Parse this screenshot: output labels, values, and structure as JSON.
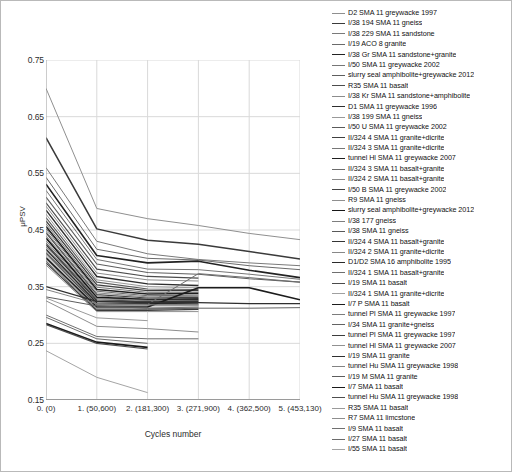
{
  "chart_data": {
    "type": "line",
    "title": "",
    "xlabel": "Cycles number",
    "ylabel": "μPSV",
    "ylim": [
      0.15,
      0.75
    ],
    "yticks": [
      "0.75",
      "0.65",
      "0.55",
      "0.45",
      "0.35",
      "0.25",
      "0.15"
    ],
    "ytick_values": [
      0.75,
      0.65,
      0.55,
      0.45,
      0.35,
      0.25,
      0.15
    ],
    "categories": [
      "0. (0)",
      "1. (50,600)",
      "2. (181,300)",
      "3. (271,900)",
      "4. (362,500)",
      "5. (453,130)"
    ],
    "x_values": [
      0,
      50600,
      181300,
      271900,
      362500,
      453130
    ],
    "grid": true,
    "legend_position": "right",
    "series": [
      {
        "name": "D2 SMA 11 greywacke 1997",
        "color": "#8f8f8f",
        "width": 1.0,
        "values": [
          0.7,
          0.488,
          0.47,
          0.458,
          0.444,
          0.433
        ]
      },
      {
        "name": "I/38 194 SMA 11 gneiss",
        "color": "#3a3a3a",
        "width": 1.5,
        "values": [
          0.613,
          0.452,
          0.432,
          0.425,
          0.412,
          0.399
        ]
      },
      {
        "name": "I/38 229 SMA 11 sandstone",
        "color": "#7a7a7a",
        "width": 1.0,
        "values": [
          0.56,
          0.43,
          0.408,
          0.398,
          0.392,
          0.387
        ]
      },
      {
        "name": "I/19 ACO 8 granite",
        "color": "#6a6a6a",
        "width": 1.0,
        "values": [
          0.543,
          0.416,
          0.4,
          0.397,
          0.387,
          0.38
        ]
      },
      {
        "name": "I/38 Gr SMA 11 sandstone+granite",
        "color": "#222222",
        "width": 1.6,
        "values": [
          0.531,
          0.405,
          0.392,
          0.395,
          0.379,
          0.366
        ]
      },
      {
        "name": "I/50 SMA 11 greywacke 2002",
        "color": "#767676",
        "width": 1.0,
        "values": [
          0.52,
          0.398,
          0.381,
          0.38,
          0.372,
          0.363
        ]
      },
      {
        "name": "slurry seal amphibolite+greywacke 2012",
        "color": "#5e5e5e",
        "width": 1.1,
        "values": [
          0.508,
          0.39,
          0.375,
          0.372,
          0.364,
          0.358
        ]
      },
      {
        "name": "R35 SMA 11 basalt",
        "color": "#4c4c4c",
        "width": 1.2,
        "values": [
          0.498,
          0.381,
          0.368,
          0.365,
          null,
          null
        ]
      },
      {
        "name": "I/38 Kr SMA 11 sandstone+amphibolite",
        "color": "#8c8c8c",
        "width": 1.0,
        "values": [
          0.492,
          0.374,
          0.362,
          0.36,
          null,
          null
        ]
      },
      {
        "name": "D1 SMA 11 greywacke 1996",
        "color": "#2e2e2e",
        "width": 1.4,
        "values": [
          0.485,
          0.368,
          0.355,
          0.352,
          null,
          null
        ]
      },
      {
        "name": "I/38 199 SMA 11 gneiss",
        "color": "#999999",
        "width": 1.0,
        "values": [
          0.478,
          0.362,
          0.35,
          0.348,
          null,
          null
        ]
      },
      {
        "name": "I/50 U SMA 11 greywacke 2002",
        "color": "#5a5a5a",
        "width": 1.1,
        "values": [
          0.472,
          0.358,
          0.346,
          0.345,
          null,
          null
        ]
      },
      {
        "name": "II/324 4 SMA 11 granite+dicrite",
        "color": "#3f3f3f",
        "width": 1.3,
        "values": [
          0.466,
          0.353,
          0.343,
          0.343,
          null,
          null
        ]
      },
      {
        "name": "II/324 3 SMA 11 granite+dicrite",
        "color": "#777777",
        "width": 1.0,
        "values": [
          0.461,
          0.349,
          0.34,
          0.34,
          null,
          null
        ]
      },
      {
        "name": "tunnel Hl SMA 11 greywacke 2007",
        "color": "#1f1f1f",
        "width": 1.6,
        "values": [
          0.456,
          0.345,
          0.337,
          0.338,
          null,
          null
        ]
      },
      {
        "name": "II/324 3 SMA 11 basalt+granite",
        "color": "#6c6c6c",
        "width": 1.0,
        "values": [
          0.452,
          0.342,
          0.334,
          0.335,
          null,
          null
        ]
      },
      {
        "name": "II/324 2 SMA 11 basalt+granite",
        "color": "#8a8a8a",
        "width": 1.0,
        "values": [
          0.448,
          0.339,
          0.332,
          0.333,
          null,
          null
        ]
      },
      {
        "name": "I/50 B SMA 11 greywacke 2002",
        "color": "#444444",
        "width": 1.2,
        "values": [
          0.445,
          0.336,
          0.33,
          0.331,
          null,
          null
        ]
      },
      {
        "name": "R9 SMA 11 gneiss",
        "color": "#8f8f8f",
        "width": 1.0,
        "values": [
          0.44,
          0.334,
          0.328,
          0.329,
          null,
          null
        ]
      },
      {
        "name": "slurry seal amphibolite+greywacke 2012",
        "color": "#161616",
        "width": 1.7,
        "values": [
          0.436,
          0.331,
          0.327,
          0.328,
          null,
          null
        ]
      },
      {
        "name": "I/38 177 gneiss",
        "color": "#7e7e7e",
        "width": 1.0,
        "values": [
          0.431,
          0.329,
          0.326,
          0.326,
          null,
          null
        ]
      },
      {
        "name": "I/38 SMA 11 gneiss",
        "color": "#595959",
        "width": 1.1,
        "values": [
          0.427,
          0.327,
          0.324,
          0.325,
          null,
          null
        ]
      },
      {
        "name": "II/324 4 SMA 11 basalt+granite",
        "color": "#353535",
        "width": 1.3,
        "values": [
          0.424,
          0.325,
          0.323,
          0.324,
          null,
          null
        ]
      },
      {
        "name": "II/324 2 SMA 11 granite+dicrite",
        "color": "#888888",
        "width": 1.0,
        "values": [
          0.42,
          0.323,
          0.322,
          0.322,
          null,
          null
        ]
      },
      {
        "name": "D1/D2 SMA 16 amphibolite 1995",
        "color": "#2a2a2a",
        "width": 1.4,
        "values": [
          0.416,
          0.321,
          0.32,
          0.321,
          null,
          null
        ]
      },
      {
        "name": "II/324 1 SMA 11 basalt+granite",
        "color": "#6f6f6f",
        "width": 1.0,
        "values": [
          0.412,
          0.319,
          0.319,
          0.373,
          0.366,
          0.358
        ]
      },
      {
        "name": "I/19 SMA 11 basalt",
        "color": "#4a4a4a",
        "width": 1.2,
        "values": [
          0.409,
          0.317,
          0.318,
          0.318,
          null,
          null
        ]
      },
      {
        "name": "II/324 1 SMA 11 granite+dicrite",
        "color": "#a0a0a0",
        "width": 1.0,
        "values": [
          0.405,
          0.316,
          0.316,
          0.316,
          null,
          null
        ]
      },
      {
        "name": "I/7 P SMA 11 basalt",
        "color": "#1c1c1c",
        "width": 1.6,
        "values": [
          0.401,
          0.314,
          0.314,
          0.348,
          0.348,
          0.327
        ]
      },
      {
        "name": "tunnel Pl SMA 11 greywacke 1997",
        "color": "#7c7c7c",
        "width": 1.0,
        "values": [
          0.398,
          0.312,
          0.312,
          0.314,
          null,
          null
        ]
      },
      {
        "name": "I/34 SMA 11 granite+gneiss",
        "color": "#636363",
        "width": 1.0,
        "values": [
          0.395,
          0.31,
          0.31,
          0.312,
          0.312,
          0.313
        ]
      },
      {
        "name": "tunnel Pl SMA 11 greywacke 1997",
        "color": "#3c3c3c",
        "width": 1.2,
        "values": [
          0.392,
          0.308,
          0.308,
          0.31,
          null,
          null
        ]
      },
      {
        "name": "tunnel Hl SMA 11 greywacke 2007",
        "color": "#919191",
        "width": 1.0,
        "values": [
          0.388,
          0.306,
          0.306,
          0.306,
          null,
          null
        ]
      },
      {
        "name": "I/19 SMA 11 granite",
        "color": "#2f2f2f",
        "width": 1.3,
        "values": [
          0.35,
          0.324,
          0.322,
          0.322,
          0.32,
          0.32
        ]
      },
      {
        "name": "tunnel Hu SMA 11 greywacke 1998",
        "color": "#838383",
        "width": 1.0,
        "values": [
          0.345,
          0.32,
          0.318,
          0.318,
          null,
          null
        ]
      },
      {
        "name": "I/19 M SMA 11 granite",
        "color": "#5d5d5d",
        "width": 1.0,
        "values": [
          0.332,
          0.316,
          0.312,
          0.312,
          null,
          null
        ]
      },
      {
        "name": "I/7 SMA 11 basalt",
        "color": "#1a1a1a",
        "width": 1.7,
        "values": [
          0.285,
          0.252,
          0.243,
          null,
          null,
          null
        ]
      },
      {
        "name": "tunnel Hu SMA 11 greywacke 1998",
        "color": "#4e4e4e",
        "width": 1.2,
        "values": [
          0.283,
          0.25,
          0.24,
          null,
          null,
          null
        ]
      },
      {
        "name": "R35 SMA 11 basalt",
        "color": "#9a9a9a",
        "width": 1.0,
        "values": [
          0.33,
          0.295,
          0.29,
          null,
          null,
          null
        ]
      },
      {
        "name": "R7 SMA 11 limcstone",
        "color": "#8e8e8e",
        "width": 1.0,
        "values": [
          0.325,
          0.28,
          0.276,
          0.27,
          null,
          null
        ]
      },
      {
        "name": "I/9 SMA 11 basalt",
        "color": "#707070",
        "width": 1.0,
        "values": [
          0.3,
          0.262,
          0.258,
          0.258,
          null,
          null
        ]
      },
      {
        "name": "I/27 SMA 11 basalt",
        "color": "#6b6b6b",
        "width": 1.0,
        "values": [
          0.296,
          0.258,
          0.25,
          null,
          null,
          null
        ]
      },
      {
        "name": "I/55 SMA 11 basalt",
        "color": "#a5a5a5",
        "width": 1.0,
        "values": [
          0.237,
          0.19,
          0.163,
          null,
          null,
          null
        ]
      }
    ]
  }
}
